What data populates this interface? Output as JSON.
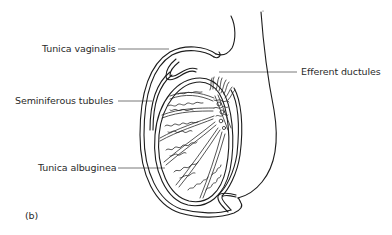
{
  "figure": {
    "panel_label": "(b)",
    "labels": {
      "tunica_vaginalis": "Tunica vaginalis",
      "seminiferous_tubules": "Seminiferous tubules",
      "tunica_albuginea": "Tunica albuginea",
      "efferent_ductules": "Efferent ductules"
    },
    "colors": {
      "line": "#1c1c1c",
      "text": "#2a2a2a",
      "background": "#ffffff"
    }
  }
}
